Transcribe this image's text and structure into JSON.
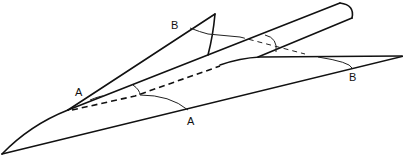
{
  "diagram": {
    "type": "line-drawing",
    "labels": {
      "a_upper": "A",
      "a_lower": "A",
      "b_upper": "B",
      "b_lower": "B"
    },
    "colors": {
      "stroke": "#111111",
      "background": "#ffffff"
    }
  }
}
